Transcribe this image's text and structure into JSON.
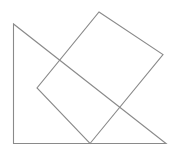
{
  "diagram": {
    "stroke_color": "#8a8a8a",
    "background": "#ffffff",
    "triangle": {
      "points": "13.5,24 13.5,143.5 166,143.5"
    },
    "rectangle": {
      "points": "99,12 163,54.5 90,143.5 37,88"
    }
  }
}
